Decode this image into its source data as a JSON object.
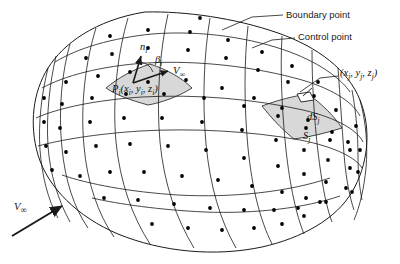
{
  "figure": {
    "kind": "3d-panel-method-body-diagram",
    "background_color": "#ffffff",
    "line_color": "#1a1a1a",
    "panel_fill": "#ffffff",
    "highlight_fill": "#d8d8d8",
    "dot_color": "#000000"
  },
  "annotations": {
    "boundary_point": {
      "label": "Boundary point",
      "text_x": 286,
      "text_y": 18,
      "leader": "M 283,15 L 252,17 L 222,30"
    },
    "control_point": {
      "label": "Control point",
      "text_x": 298,
      "text_y": 40,
      "leader": "M 295,38 L 272,40 L 252,48"
    },
    "vertex_coords": {
      "label": "(x",
      "label_sub1": "j",
      "label_mid": ", y",
      "label_sub2": "j",
      "label_mid2": ", z",
      "label_sub3": "j",
      "label_end": ")",
      "full": "(xj, yj, zj)",
      "text_x": 340,
      "text_y": 76,
      "leader": "M 338,76 L 320,78 L 300,92"
    },
    "control_point_label": {
      "p": "P",
      "p_sub": "i",
      "coords_open": "(x",
      "sub_i1": "i",
      "c1": ", y",
      "sub_i2": "i",
      "c2": ", z",
      "sub_i3": "i",
      "close": ")",
      "full": "Pi(xi, yi, zi)",
      "text_x": 112,
      "text_y": 92
    },
    "normal_vector": {
      "symbol": "n",
      "subscript": "i",
      "text_x": 140,
      "text_y": 50,
      "arrow": "M 133,83 L 141,56"
    },
    "beta_angle": {
      "symbol": "β",
      "subscript": "i",
      "text_x": 155,
      "text_y": 63,
      "arc": "M 140,62 A 16,16 0 0 1 153,72"
    },
    "freestream_local": {
      "symbol": "V",
      "subscript": "∞",
      "text_x": 173,
      "text_y": 74,
      "arrow": "M 133,83 L 168,71"
    },
    "freestream_main": {
      "symbol": "V",
      "subscript": "∞",
      "text_x": 14,
      "text_y": 210,
      "arrow": "M 12,236 L 62,206"
    },
    "element_dS": {
      "symbol": "dS",
      "subscript": "j",
      "text_x": 307,
      "text_y": 120
    },
    "panel_S": {
      "symbol": "S",
      "subscript": "j",
      "text_x": 303,
      "text_y": 139
    }
  },
  "geometry": {
    "silhouette": "M 145,12 C 185,11 235,18 278,33 C 318,47 348,70 360,100 C 372,130 368,165 352,192 C 336,219 302,238 262,247 C 215,257 162,252 118,234 C 78,217 48,188 38,155 C 29,124 33,92 48,68 C 63,44 95,20 145,12 Z",
    "longitudinal_rows": [
      "M 38,146 C 60,140 95,134 140,131 C 192,128 250,131 300,140 C 336,147 356,158 362,168",
      "M 36,118 C 58,108 96,100 142,97 C 196,94 254,99 303,110 C 338,118 358,131 363,142",
      "M 42,88 C 64,76 100,66 146,63 C 200,60 256,67 302,80 C 336,90 354,104 360,116",
      "M 55,62 C 78,48 112,38 152,34 C 202,30 252,38 290,52 C 322,64 342,80 350,92",
      "M 92,198 C 118,204 160,210 205,212 C 255,214 305,208 340,196",
      "M 62,175 C 88,184 130,192 178,195 C 232,198 288,192 330,178"
    ],
    "transverse_lines": [
      "M 70,44 C 62,72 58,110 62,148 C 65,180 74,208 88,228",
      "M 96,28 C 86,60 80,104 84,146 C 87,182 98,214 114,237",
      "M 128,18 C 118,52 112,98 116,142 C 120,182 132,216 150,244",
      "M 168,14 C 160,50 156,98 160,142 C 164,184 176,218 194,248",
      "M 210,18 C 204,54 202,100 206,144 C 210,186 220,220 236,248",
      "M 248,26 C 244,62 244,106 248,148 C 252,188 260,220 272,244",
      "M 282,36 C 280,70 282,112 286,150 C 290,186 296,214 304,234",
      "M 312,50 C 312,82 314,118 318,152 C 322,184 326,206 332,222",
      "M 338,68 C 340,96 342,126 344,154 C 346,180 350,198 354,210",
      "M 352,90 C 356,112 358,134 358,156 C 358,176 360,190 362,200"
    ],
    "nose_slivers": [
      "M 48,68 C 42,92 38,122 40,150 C 42,176 48,200 58,218",
      "M 56,56 C 50,82 46,114 48,146 C 50,174 58,200 70,222"
    ],
    "tail_slivers": [
      "M 360,100 C 366,122 368,146 366,168 C 364,188 360,206 354,220"
    ],
    "highlight_panels": [
      {
        "name": "control-panel-i",
        "path": "M 106,88 C 118,78 132,70 150,64 C 168,70 182,78 192,88 C 178,97 160,103 148,105 C 130,100 116,95 106,88 Z"
      },
      {
        "name": "panel-j",
        "path": "M 262,106 C 278,100 294,96 308,94 C 322,104 334,116 342,128 C 326,133 310,137 294,139 C 280,128 270,116 262,106 Z"
      }
    ],
    "element_dS_shape": "M 297,94 L 310,92 L 314,100 L 301,102 Z",
    "element_dS_arrow": "M 312,88 L 303,96",
    "control_points": [
      [
        110,
        36
      ],
      [
        148,
        30
      ],
      [
        190,
        32
      ],
      [
        228,
        40
      ],
      [
        262,
        52
      ],
      [
        292,
        66
      ],
      [
        318,
        82
      ],
      [
        86,
        58
      ],
      [
        112,
        54
      ],
      [
        148,
        48
      ],
      [
        188,
        50
      ],
      [
        226,
        58
      ],
      [
        258,
        70
      ],
      [
        288,
        82
      ],
      [
        314,
        96
      ],
      [
        336,
        110
      ],
      [
        66,
        82
      ],
      [
        98,
        76
      ],
      [
        130,
        72
      ],
      [
        148,
        82
      ],
      [
        186,
        80
      ],
      [
        222,
        88
      ],
      [
        254,
        98
      ],
      [
        282,
        108
      ],
      [
        308,
        120
      ],
      [
        332,
        132
      ],
      [
        348,
        142
      ],
      [
        62,
        104
      ],
      [
        92,
        98
      ],
      [
        126,
        94
      ],
      [
        164,
        94
      ],
      [
        204,
        98
      ],
      [
        244,
        106
      ],
      [
        278,
        116
      ],
      [
        306,
        128
      ],
      [
        330,
        140
      ],
      [
        350,
        150
      ],
      [
        60,
        128
      ],
      [
        90,
        122
      ],
      [
        124,
        118
      ],
      [
        162,
        118
      ],
      [
        202,
        122
      ],
      [
        242,
        130
      ],
      [
        276,
        140
      ],
      [
        304,
        150
      ],
      [
        328,
        160
      ],
      [
        350,
        168
      ],
      [
        66,
        152
      ],
      [
        96,
        146
      ],
      [
        130,
        144
      ],
      [
        168,
        146
      ],
      [
        206,
        150
      ],
      [
        244,
        158
      ],
      [
        278,
        166
      ],
      [
        304,
        174
      ],
      [
        326,
        182
      ],
      [
        346,
        188
      ],
      [
        80,
        176
      ],
      [
        110,
        172
      ],
      [
        144,
        172
      ],
      [
        182,
        176
      ],
      [
        218,
        180
      ],
      [
        252,
        186
      ],
      [
        282,
        192
      ],
      [
        306,
        198
      ],
      [
        326,
        202
      ],
      [
        104,
        198
      ],
      [
        138,
        200
      ],
      [
        174,
        204
      ],
      [
        210,
        208
      ],
      [
        244,
        210
      ],
      [
        274,
        210
      ],
      [
        298,
        208
      ],
      [
        320,
        202
      ],
      [
        152,
        224
      ],
      [
        188,
        228
      ],
      [
        222,
        230
      ],
      [
        254,
        228
      ],
      [
        282,
        224
      ],
      [
        304,
        216
      ],
      [
        44,
        98
      ],
      [
        44,
        122
      ],
      [
        46,
        146
      ],
      [
        52,
        170
      ],
      [
        356,
        126
      ],
      [
        360,
        150
      ],
      [
        358,
        172
      ],
      [
        352,
        192
      ],
      [
        200,
        18
      ]
    ]
  }
}
